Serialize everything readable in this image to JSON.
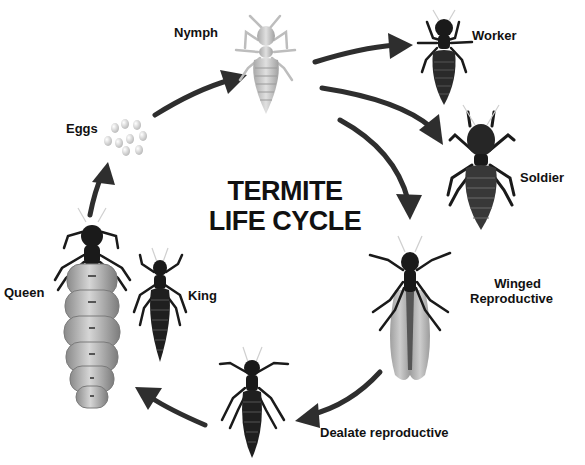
{
  "diagram": {
    "title_line1": "TERMITE",
    "title_line2": "LIFE CYCLE",
    "colors": {
      "arrow": "#2e2e2e",
      "dark_insect": "#1a1a1a",
      "light_insect": "#c8c8c8",
      "queen_abdomen": "#a9a9a9",
      "wing": "#9c9c9c",
      "text": "#111111"
    },
    "stages": [
      {
        "id": "nymph",
        "label": "Nymph"
      },
      {
        "id": "worker",
        "label": "Worker"
      },
      {
        "id": "soldier",
        "label": "Soldier"
      },
      {
        "id": "winged",
        "label_line1": "Winged",
        "label_line2": "Reproductive"
      },
      {
        "id": "dealate",
        "label": "Dealate reproductive"
      },
      {
        "id": "queen",
        "label": "Queen"
      },
      {
        "id": "king",
        "label": "King"
      },
      {
        "id": "eggs",
        "label": "Eggs"
      }
    ],
    "flow": [
      {
        "from": "eggs",
        "to": "nymph"
      },
      {
        "from": "nymph",
        "to": "worker"
      },
      {
        "from": "nymph",
        "to": "soldier"
      },
      {
        "from": "nymph",
        "to": "winged"
      },
      {
        "from": "winged",
        "to": "dealate"
      },
      {
        "from": "dealate",
        "to": "queen"
      },
      {
        "from": "queen",
        "to": "eggs"
      }
    ]
  }
}
